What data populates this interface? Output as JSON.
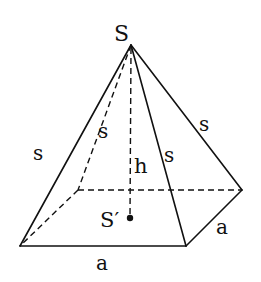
{
  "diagram": {
    "stroke_color": "#111111",
    "background": "#ffffff",
    "vertices": {
      "apex": {
        "label": "S",
        "x": 131,
        "y": 45
      },
      "front_left": {
        "x": 20,
        "y": 246
      },
      "front_right": {
        "x": 186,
        "y": 246
      },
      "back_right": {
        "x": 242,
        "y": 190
      },
      "back_left": {
        "x": 78,
        "y": 190
      },
      "base_center": {
        "label": "S′",
        "x": 130,
        "y": 218
      }
    },
    "labels": {
      "apex": "S",
      "base_center": "S′",
      "height": "h",
      "edge_left": "s",
      "edge_back_left": "s",
      "edge_front_right": "s",
      "edge_back_right": "s",
      "base_front": "a",
      "base_right": "a"
    }
  }
}
